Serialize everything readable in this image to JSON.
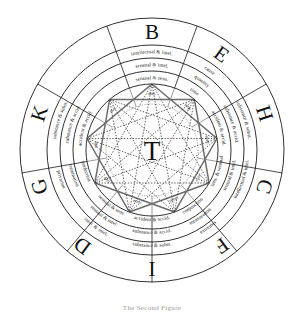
{
  "figure": {
    "center_label": "T",
    "caption": "The Second Figure",
    "background": "#ffffff",
    "ink": "#111111",
    "star_solid_color": "#6d6d6d",
    "star_dotted_color": "#2a2a2a"
  },
  "outer_letters": [
    {
      "id": "B",
      "label": "B",
      "angle_deg": 270
    },
    {
      "id": "E",
      "label": "E",
      "angle_deg": 306
    },
    {
      "id": "H",
      "label": "H",
      "angle_deg": 342
    },
    {
      "id": "C",
      "label": "C",
      "angle_deg": 18
    },
    {
      "id": "F",
      "label": "F",
      "angle_deg": 54
    },
    {
      "id": "I",
      "label": "I",
      "angle_deg": 90
    },
    {
      "id": "D",
      "label": "D",
      "angle_deg": 126
    },
    {
      "id": "G",
      "label": "G",
      "angle_deg": 162
    },
    {
      "id": "K",
      "label": "K",
      "angle_deg": 198
    }
  ],
  "sectors": [
    {
      "letter": "B",
      "angle_deg": 270,
      "bands": [
        "intellectual & intel.",
        "sensual & intel.",
        "sensual & sens."
      ]
    },
    {
      "letter": "E",
      "angle_deg": 306,
      "bands": [
        "cause",
        "quantity",
        "time"
      ]
    },
    {
      "letter": "H",
      "angle_deg": 342,
      "bands": [
        "substance & subst.",
        "substance & accid.",
        "accident & accid."
      ]
    },
    {
      "letter": "C",
      "angle_deg": 18,
      "bands": [
        "intellectual & intel.",
        "sensual & intel.",
        "sens. & sensual"
      ]
    },
    {
      "letter": "F",
      "angle_deg": 54,
      "bands": [
        "extremes",
        "mensuration",
        "conjunction"
      ]
    },
    {
      "letter": "I",
      "angle_deg": 90,
      "bands": [
        "substance & subst.",
        "substance & accid.",
        "accident & accid."
      ]
    },
    {
      "letter": "D",
      "angle_deg": 126,
      "bands": [
        "intel. & intel.",
        "sensual & intel.",
        "sensual & sens."
      ]
    },
    {
      "letter": "G",
      "angle_deg": 162,
      "bands": [
        "privation",
        "termination",
        "perfection"
      ]
    },
    {
      "letter": "K",
      "angle_deg": 198,
      "bands": [
        "substance & subst.",
        "substance & accid.",
        "accident & accid."
      ]
    }
  ],
  "core_labels": [
    {
      "label": "diff.",
      "angle_deg": 270
    },
    {
      "label": "beg.",
      "angle_deg": 310
    },
    {
      "label": "spec.",
      "angle_deg": 350
    },
    {
      "label": "conc.",
      "angle_deg": 30
    },
    {
      "label": "prop.",
      "angle_deg": 66
    },
    {
      "label": "end.",
      "angle_deg": 106
    },
    {
      "label": "gen.",
      "angle_deg": 146
    },
    {
      "label": "sub.",
      "angle_deg": 186
    },
    {
      "label": "maj.",
      "angle_deg": 226
    }
  ],
  "geometry": {
    "cx": 152,
    "cy": 150,
    "radii": [
      132,
      105,
      92,
      79,
      66
    ],
    "core_radius": 46,
    "star_radius": 66,
    "sector_count": 9
  }
}
